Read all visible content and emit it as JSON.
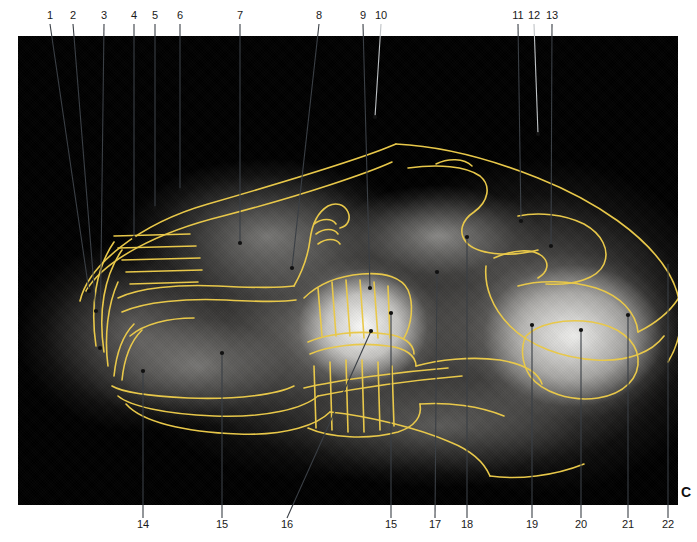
{
  "figure": {
    "panel_letter": "C",
    "modality": "radiograph",
    "trace_color": "#e8c84a",
    "leader_color": "#bfc3c6",
    "leader_dark_color": "#3a3f45",
    "background_color": "#000000"
  },
  "labels_top": [
    {
      "n": "1",
      "x": 50,
      "tip_x": 89,
      "tip_y": 291
    },
    {
      "n": "2",
      "x": 73,
      "tip_x": 96,
      "tip_y": 311
    },
    {
      "n": "3",
      "x": 104,
      "tip_x": 100,
      "tip_y": 348
    },
    {
      "n": "4",
      "x": 134,
      "tip_x": 134,
      "tip_y": 238
    },
    {
      "n": "5",
      "x": 155,
      "tip_x": 155,
      "tip_y": 208
    },
    {
      "n": "6",
      "x": 180,
      "tip_x": 180,
      "tip_y": 190
    },
    {
      "n": "7",
      "x": 240,
      "tip_x": 240,
      "tip_y": 243
    },
    {
      "n": "8",
      "x": 319,
      "tip_x": 292,
      "tip_y": 268
    },
    {
      "n": "9",
      "x": 363,
      "tip_x": 370,
      "tip_y": 288
    },
    {
      "n": "10",
      "x": 381,
      "tip_x": 375,
      "tip_y": 117
    },
    {
      "n": "11",
      "x": 518,
      "tip_x": 521,
      "tip_y": 221
    },
    {
      "n": "12",
      "x": 534,
      "tip_x": 538,
      "tip_y": 134
    },
    {
      "n": "13",
      "x": 552,
      "tip_x": 551,
      "tip_y": 246
    }
  ],
  "labels_bottom": [
    {
      "n": "14",
      "x": 143,
      "tip_x": 143,
      "tip_y": 371
    },
    {
      "n": "15",
      "x": 222,
      "tip_x": 222,
      "tip_y": 353
    },
    {
      "n": "16",
      "x": 287,
      "tip_x": 371,
      "tip_y": 331
    },
    {
      "n": "15",
      "x": 391,
      "tip_x": 391,
      "tip_y": 313
    },
    {
      "n": "17",
      "x": 435,
      "tip_x": 437,
      "tip_y": 272
    },
    {
      "n": "18",
      "x": 467,
      "tip_x": 467,
      "tip_y": 237
    },
    {
      "n": "19",
      "x": 532,
      "tip_x": 532,
      "tip_y": 325
    },
    {
      "n": "20",
      "x": 581,
      "tip_x": 581,
      "tip_y": 330
    },
    {
      "n": "21",
      "x": 628,
      "tip_x": 628,
      "tip_y": 315
    },
    {
      "n": "22",
      "x": 668,
      "tip_x": 668,
      "tip_y": 262
    }
  ],
  "traces": {
    "description": "yellow anatomical outline overlay",
    "paths": [
      "M 62 265 C 70 230, 120 188, 190 168 C 280 142, 355 118, 378 108",
      "M 68 255 C 86 224, 140 196, 205 180 C 290 158, 352 136, 374 126",
      "M 78 310 C 72 270, 78 232, 96 206",
      "M 86 316 C 80 276, 86 240, 104 214",
      "M 90 330 C 86 300, 90 268, 100 246",
      "M 96 200 L 172 198 M 100 212 L 178 210 M 104 224 L 182 222 M 108 236 L 184 234 M 112 248 L 180 246",
      "M 100 262 C 120 252, 160 248, 200 250 C 240 252, 262 252, 276 250",
      "M 104 276 C 126 266, 168 262, 208 264 C 246 266, 266 266, 278 264",
      "M 112 300 C 126 288, 150 282, 176 282",
      "M 96 340 C 98 320, 104 300, 116 288",
      "M 104 344 C 106 324, 112 306, 124 294",
      "M 94 350 C 104 356, 130 360, 170 362 C 220 364, 260 358, 276 350",
      "M 100 360 C 112 370, 146 378, 196 380 C 250 382, 286 372, 300 360",
      "M 108 368 C 124 386, 166 396, 220 398 C 270 400, 300 388, 312 376",
      "M 276 250 C 284 236, 290 220, 292 204 C 294 188, 300 176, 310 170 C 318 166, 326 168, 330 176 C 333 183, 330 190, 322 192",
      "M 296 188 C 304 182, 314 182, 318 188",
      "M 298 198 C 306 192, 316 192, 320 198",
      "M 300 208 C 308 202, 318 202, 322 208",
      "M 286 262 C 300 248, 320 240, 344 238 C 368 236, 384 242, 390 254 C 396 268, 394 288, 386 302",
      "M 300 252 L 304 300 M 314 246 L 318 300 M 328 244 L 332 300 M 342 244 L 346 302 M 356 246 L 360 302 M 370 250 L 372 302",
      "M 290 306 C 308 298, 340 294, 368 298 C 386 300, 396 308, 396 318",
      "M 292 318 C 310 310, 342 306, 370 310 C 388 312, 398 320, 398 330",
      "M 296 330 L 298 392 M 312 326 L 314 394 M 328 324 L 330 396 M 344 324 L 346 396 M 360 326 L 362 394 M 374 330 L 376 390",
      "M 290 392 C 312 402, 350 404, 380 396 C 398 390, 404 380, 402 368",
      "M 378 108 C 420 110, 470 122, 520 142 C 580 166, 628 200, 650 236 C 668 266, 666 300, 650 326",
      "M 390 132 C 420 128, 448 130, 462 140 C 474 150, 470 166, 456 176 C 444 184, 440 196, 448 206 C 458 218, 490 222, 520 214",
      "M 418 128 C 430 122, 446 122, 454 130",
      "M 500 180 C 520 176, 546 178, 566 188 C 584 198, 592 214, 586 228 C 580 242, 556 250, 528 248",
      "M 500 250 C 520 244, 552 244, 578 252 C 602 260, 618 276, 620 296",
      "M 476 222 C 494 214, 514 212, 524 220 C 532 227, 530 236, 520 242",
      "M 468 230 C 466 250, 474 272, 492 290 C 512 310, 544 322, 578 324 C 610 326, 634 316, 646 300",
      "M 508 300 C 520 288, 546 282, 574 286 C 600 290, 618 304, 620 322 C 622 342, 606 358, 580 362 C 552 366, 524 356, 512 340 C 504 328, 502 312, 508 300",
      "M 398 330 C 420 324, 452 320, 482 324 C 506 328, 520 336, 524 348",
      "M 286 352 C 320 344, 380 336, 430 332",
      "M 300 360 C 340 352, 398 344, 444 340",
      "M 312 376 C 350 380, 400 392, 432 406 C 452 414, 466 426, 472 440",
      "M 472 440 C 500 444, 536 440, 566 428",
      "M 402 368 C 430 366, 462 370, 486 380",
      "M 620 296 C 640 286, 656 272, 664 256"
    ]
  }
}
